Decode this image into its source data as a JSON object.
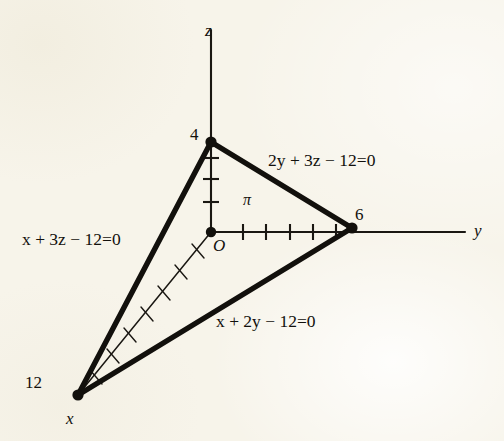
{
  "figure": {
    "kind": "3d-coordinate-axes-plane-diagram",
    "background_color": "#f7f4ea",
    "ink_color": "#12100c",
    "axes": [
      {
        "name": "z",
        "label": "z",
        "label_x": 205,
        "label_y": 22,
        "orientation": "vertical-up"
      },
      {
        "name": "y",
        "label": "y",
        "label_x": 474,
        "label_y": 222,
        "orientation": "horizontal-right"
      },
      {
        "name": "x",
        "label": "x",
        "label_x": 66,
        "label_y": 410,
        "orientation": "diagonal-down-left"
      }
    ],
    "origin": {
      "label": "O",
      "label_x": 213,
      "label_y": 237,
      "x": 211,
      "y": 232
    },
    "intercepts": [
      {
        "axis": "z",
        "value": "4",
        "label_x": 190,
        "label_y": 126,
        "point_x": 211,
        "point_y": 142
      },
      {
        "axis": "y",
        "value": "6",
        "label_x": 355,
        "label_y": 206,
        "point_x": 352,
        "point_y": 228
      },
      {
        "axis": "x",
        "value": "12",
        "label_x": 25,
        "label_y": 374,
        "point_x": 78,
        "point_y": 395
      }
    ],
    "plane": {
      "label": "π",
      "label_x": 243,
      "label_y": 192
    },
    "edge_equations": [
      {
        "name": "yz-trace",
        "text": "2y + 3z − 12=0",
        "label_x": 268,
        "label_y": 152
      },
      {
        "name": "xz-trace",
        "text": "x + 3z − 12=0",
        "label_x": 22,
        "label_y": 231
      },
      {
        "name": "xy-trace",
        "text": "x + 2y − 12=0",
        "label_x": 216,
        "label_y": 313
      }
    ],
    "tick_counts": {
      "z_axis": 3,
      "y_axis": 5,
      "x_axis": 7
    }
  }
}
